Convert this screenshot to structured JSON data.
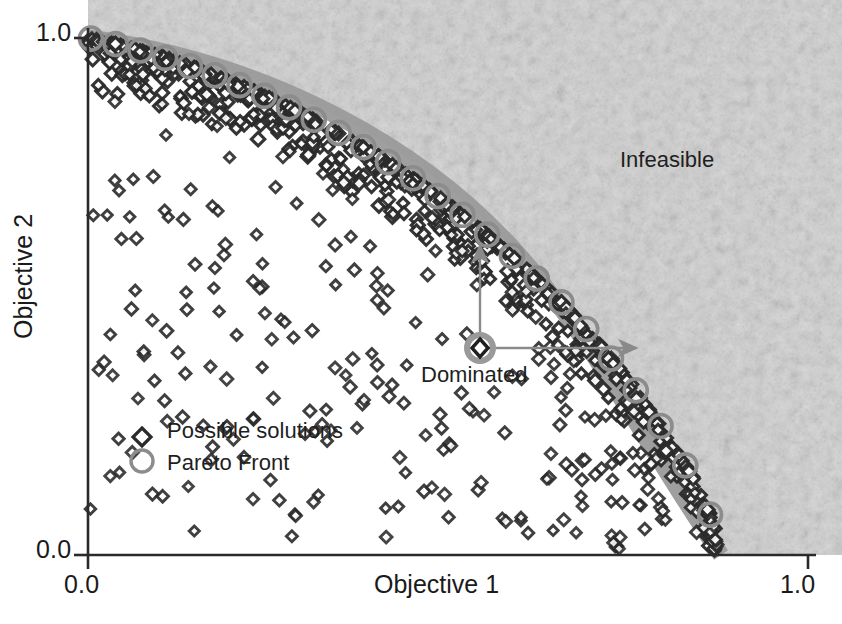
{
  "chart_data": {
    "type": "scatter",
    "title": "",
    "xlabel": "Objective 1",
    "ylabel": "Objective 2",
    "xlim": [
      0.0,
      1.0
    ],
    "ylim": [
      0.0,
      1.0
    ],
    "xticks": [
      "0.0",
      "1.0"
    ],
    "yticks": [
      "0.0",
      "1.0"
    ],
    "grid": false,
    "legend_position": "lower-left-inside",
    "legend": [
      {
        "label": "Possible solutions",
        "marker": "diamond",
        "color": "#2b2b2b",
        "fill": "#ffffff"
      },
      {
        "label": "Pareto Front",
        "marker": "circle-open",
        "color": "#8c8c8c",
        "fill": "none"
      }
    ],
    "annotations": [
      {
        "text": "Infeasible",
        "x": 0.74,
        "y": 0.76
      },
      {
        "text": "Dominated",
        "x": 0.46,
        "y": 0.37
      }
    ],
    "regions": [
      {
        "name": "infeasible-region",
        "description": "textured light gray area beyond the Pareto frontier",
        "fill": "#d0d0d0"
      },
      {
        "name": "pareto-boundary-band",
        "description": "medium gray band tracing the Pareto frontier",
        "fill": "#9a9a9a"
      }
    ],
    "dominated_point": {
      "x": 0.545,
      "y": 0.425
    },
    "improvement_arrows": [
      {
        "from": [
          0.545,
          0.425
        ],
        "to": [
          0.545,
          0.705
        ],
        "direction": "up"
      },
      {
        "from": [
          0.545,
          0.425
        ],
        "to": [
          0.762,
          0.425
        ],
        "direction": "right"
      }
    ],
    "pareto_front_curve": {
      "description": "convex frontier from (0,1) to (0.88,0)",
      "points": [
        [
          0.0,
          1.0
        ],
        [
          0.05,
          0.985
        ],
        [
          0.1,
          0.965
        ],
        [
          0.15,
          0.942
        ],
        [
          0.2,
          0.915
        ],
        [
          0.25,
          0.885
        ],
        [
          0.3,
          0.852
        ],
        [
          0.35,
          0.815
        ],
        [
          0.4,
          0.775
        ],
        [
          0.45,
          0.73
        ],
        [
          0.5,
          0.68
        ],
        [
          0.55,
          0.625
        ],
        [
          0.6,
          0.565
        ],
        [
          0.65,
          0.5
        ],
        [
          0.7,
          0.425
        ],
        [
          0.75,
          0.34
        ],
        [
          0.8,
          0.24
        ],
        [
          0.84,
          0.15
        ],
        [
          0.87,
          0.06
        ],
        [
          0.88,
          0.0
        ]
      ]
    },
    "series": [
      {
        "name": "Possible solutions",
        "marker": "diamond",
        "n_points": 420,
        "description": "Dense cloud of feasible solutions filling the region under the Pareto frontier, thickest just inside the frontier."
      },
      {
        "name": "Pareto Front",
        "marker": "circle-open",
        "n_points": 26,
        "description": "Open gray circles marking non-dominated solutions along the upper-left frontier."
      }
    ]
  },
  "axes": {
    "x_title": "Objective 1",
    "y_title": "Objective 2",
    "x_tick_min": "0.0",
    "x_tick_max": "1.0",
    "y_tick_min": "0.0",
    "y_tick_max": "1.0"
  },
  "labels": {
    "infeasible": "Infeasible",
    "dominated": "Dominated"
  },
  "legend": {
    "items": [
      {
        "label": "Possible solutions"
      },
      {
        "label": "Pareto Front"
      }
    ]
  },
  "colors": {
    "axis": "#1a1a1a",
    "text": "#1f1f1f",
    "marker_outline": "#2b2b2b",
    "marker_fill": "#ffffff",
    "pareto_circle": "#8c8c8c",
    "infeasible_fill": "#d0d0d0",
    "boundary_band": "#9a9a9a",
    "annotation_line": "#8a8a8a"
  }
}
